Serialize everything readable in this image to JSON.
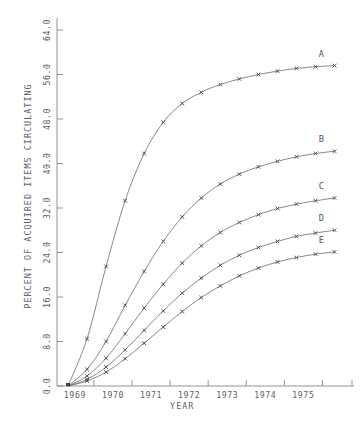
{
  "chart_data": {
    "type": "line",
    "title": "",
    "xlabel": "YEAR",
    "ylabel": "PERCENT OF ACQUIRED ITEMS CIRCULATING",
    "x_tick_labels": [
      "1969",
      "1970",
      "1971",
      "1972",
      "1973",
      "1974",
      "1975"
    ],
    "y_tick_labels": [
      "0.0",
      "8.0",
      "16.0",
      "24.0",
      "32.0",
      "40.0",
      "48.0",
      "56.0",
      "64.0"
    ],
    "y_tick_values": [
      0.0,
      8.0,
      16.0,
      24.0,
      32.0,
      40.0,
      48.0,
      56.0,
      64.0
    ],
    "xlim": [
      1968.6,
      1975.9
    ],
    "ylim": [
      0.0,
      66.0
    ],
    "grid": false,
    "legend_position": "right-inline-labels",
    "marker": "x",
    "x": [
      1968.6,
      1969.1,
      1969.6,
      1970.1,
      1970.6,
      1971.1,
      1971.6,
      1972.1,
      1972.6,
      1973.1,
      1973.6,
      1974.1,
      1974.6,
      1975.1,
      1975.6
    ],
    "series": [
      {
        "name": "A",
        "label": "A",
        "values": [
          0.0,
          8.5,
          21.5,
          33.3,
          41.8,
          47.4,
          50.8,
          52.8,
          54.2,
          55.2,
          56.0,
          56.6,
          57.1,
          57.4,
          57.6
        ]
      },
      {
        "name": "B",
        "label": "B",
        "values": [
          0.0,
          3.0,
          8.0,
          14.5,
          20.6,
          26.0,
          30.4,
          33.8,
          36.3,
          38.1,
          39.4,
          40.4,
          41.2,
          41.8,
          42.2
        ]
      },
      {
        "name": "C",
        "label": "C",
        "values": [
          0.0,
          1.8,
          5.0,
          9.4,
          14.0,
          18.3,
          22.1,
          25.2,
          27.6,
          29.4,
          30.8,
          31.9,
          32.7,
          33.3,
          33.8
        ]
      },
      {
        "name": "D",
        "label": "D",
        "values": [
          0.0,
          1.2,
          3.4,
          6.5,
          10.0,
          13.5,
          16.7,
          19.4,
          21.7,
          23.5,
          24.9,
          26.0,
          26.9,
          27.5,
          28.0
        ]
      },
      {
        "name": "E",
        "label": "E",
        "values": [
          0.0,
          0.9,
          2.5,
          4.9,
          7.7,
          10.6,
          13.4,
          15.9,
          18.0,
          19.8,
          21.2,
          22.3,
          23.1,
          23.7,
          24.1
        ]
      }
    ]
  }
}
